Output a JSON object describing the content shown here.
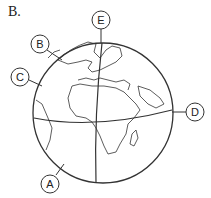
{
  "figure": {
    "label": "B.",
    "callouts": [
      {
        "id": "A",
        "letter": "A"
      },
      {
        "id": "B",
        "letter": "B"
      },
      {
        "id": "C",
        "letter": "C"
      },
      {
        "id": "D",
        "letter": "D"
      },
      {
        "id": "E",
        "letter": "E"
      }
    ],
    "colors": {
      "line": "#333333",
      "background": "#ffffff"
    }
  }
}
